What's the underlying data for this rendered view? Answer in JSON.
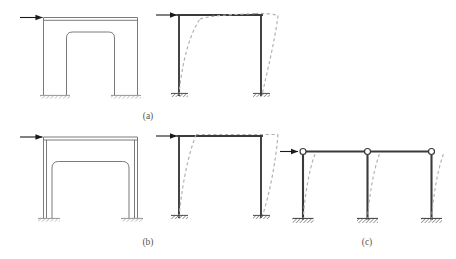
{
  "figure": {
    "type": "structural-diagram",
    "background_color": "#ffffff",
    "line_color": "#3a3a3a",
    "thin_line_color": "#6b6b6b",
    "dashed_color": "#b0b0b0",
    "support_hatch_color": "#8a8a8a",
    "arrow_color": "#1a1a1a",
    "hinge_fill": "#ffffff"
  },
  "panels": [
    {
      "id": "a",
      "caption": "(a)",
      "caption_x": 148,
      "caption_y": 119,
      "elevation": {
        "name": "squat-wall-with-small-opening",
        "load_arrow_label": "lateral-load-arrow",
        "support_type": "fixed",
        "opening": "rounded-rectangle-door-opening-short"
      },
      "deformed": {
        "name": "frame-deformed-shape-flexural",
        "load_arrow_label": "lateral-load-arrow",
        "support_type": "fixed",
        "deformation_mode": "double-curvature-with-beam-flexure"
      }
    },
    {
      "id": "b",
      "caption": "(b)",
      "caption_x": 148,
      "caption_y": 245,
      "elevation": {
        "name": "wall-with-tall-opening",
        "load_arrow_label": "lateral-load-arrow",
        "support_type": "fixed",
        "opening": "rounded-rectangle-door-opening-tall"
      },
      "deformed": {
        "name": "frame-deformed-shape-rigid-beam",
        "load_arrow_label": "lateral-load-arrow",
        "support_type": "fixed",
        "deformation_mode": "shear-sway-rigid-beam"
      }
    },
    {
      "id": "c",
      "caption": "(c)",
      "caption_x": 367,
      "caption_y": 245,
      "deformed": {
        "name": "pinned-top-column-frame",
        "load_arrow_label": "lateral-load-arrow",
        "support_type": "fixed",
        "top_connection": "pinned-hinge",
        "column_count": 3,
        "deformation_mode": "cantilever-single-curvature"
      }
    }
  ],
  "labels": {
    "a": "(a)",
    "b": "(b)",
    "c": "(c)"
  }
}
